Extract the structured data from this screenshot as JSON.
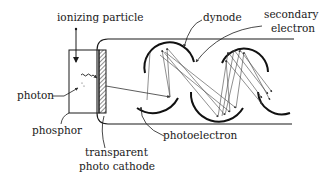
{
  "diagram": {
    "type": "photomultiplier-tube schematic",
    "labels": {
      "ionizing_particle": "ionizing particle",
      "dynode": "dynode",
      "secondary_electron_1": "secondary",
      "secondary_electron_2": "electron",
      "photon": "photon",
      "phosphor": "phosphor",
      "photocathode_1": "transparent",
      "photocathode_2": "photo cathode",
      "photoelectron": "photoelectron"
    },
    "components": [
      "ionizing particle",
      "phosphor",
      "photon",
      "transparent photo cathode",
      "photoelectron",
      "dynode",
      "secondary electron"
    ],
    "colors": {
      "ink": "#1a1a1a",
      "background": "#ffffff"
    }
  }
}
